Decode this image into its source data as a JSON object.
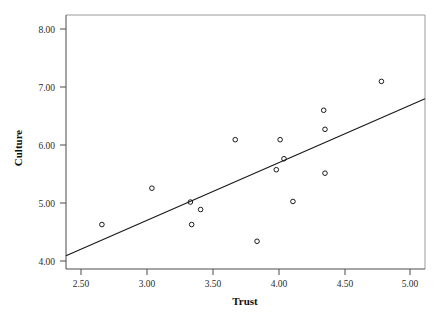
{
  "chart_data": {
    "type": "scatter",
    "title": "",
    "xlabel": "Trust",
    "ylabel": "Culture",
    "xlim": [
      2.33,
      5.13
    ],
    "ylim": [
      3.85,
      8.25
    ],
    "xticks": [
      "2.50",
      "3.00",
      "3.50",
      "4.00",
      "4.50",
      "5.00"
    ],
    "xtick_values": [
      2.5,
      3.0,
      3.5,
      4.0,
      4.5,
      5.0
    ],
    "yticks": [
      "4.00",
      "5.00",
      "6.00",
      "7.00",
      "8.00"
    ],
    "ytick_values": [
      4.0,
      5.0,
      6.0,
      7.0,
      8.0
    ],
    "grid": false,
    "legend": false,
    "legend_position": "none",
    "marker": "open-circle",
    "points": [
      {
        "x": 2.61,
        "y": 4.62
      },
      {
        "x": 3.0,
        "y": 5.25
      },
      {
        "x": 3.3,
        "y": 5.01
      },
      {
        "x": 3.31,
        "y": 4.62
      },
      {
        "x": 3.38,
        "y": 4.88
      },
      {
        "x": 3.65,
        "y": 6.09
      },
      {
        "x": 3.82,
        "y": 4.33
      },
      {
        "x": 3.97,
        "y": 5.57
      },
      {
        "x": 4.0,
        "y": 6.09
      },
      {
        "x": 4.03,
        "y": 5.76
      },
      {
        "x": 4.1,
        "y": 5.02
      },
      {
        "x": 4.34,
        "y": 6.6
      },
      {
        "x": 4.35,
        "y": 6.27
      },
      {
        "x": 4.35,
        "y": 5.51
      },
      {
        "x": 4.79,
        "y": 7.1
      }
    ],
    "fit_line": {
      "name": "linear-fit",
      "x_start": 2.33,
      "y_start": 4.08,
      "x_end": 5.13,
      "y_end": 6.8
    }
  },
  "axes": {
    "x_title": "Trust",
    "y_title": "Culture"
  }
}
